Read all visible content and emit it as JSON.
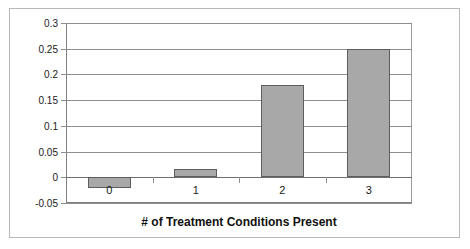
{
  "chart_data": {
    "type": "bar",
    "title": "",
    "subtitle": "",
    "xlabel": "# of Treatment Conditions Present",
    "ylabel": "",
    "categories": [
      "0",
      "1",
      "2",
      "3"
    ],
    "values": [
      -0.02,
      0.017,
      0.18,
      0.25
    ],
    "series": [
      {
        "name": "Effect",
        "values": [
          -0.02,
          0.017,
          0.18,
          0.25
        ]
      }
    ],
    "ylim": [
      -0.05,
      0.3
    ],
    "yticks": [
      0.3,
      0.25,
      0.2,
      0.15,
      0.1,
      0.05,
      0,
      -0.05
    ],
    "ytick_labels": [
      "0.3",
      "0.25",
      "0.2",
      "0.15",
      "0.1",
      "0.05",
      "0",
      "-0.05"
    ],
    "grid": true,
    "grid_axis": "y",
    "legend": false,
    "legend_position": "none",
    "bar_color": "#a8a8a8",
    "bar_edge_color": "#5d5d5d",
    "gridline_color": "#8e8e8e",
    "axis_color": "#808080",
    "background": "#ffffff",
    "annotations": []
  }
}
